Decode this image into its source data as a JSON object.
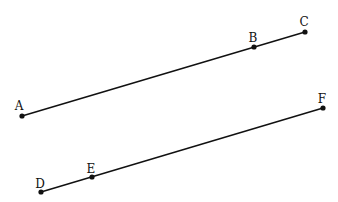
{
  "diagram": {
    "type": "geometry-parallel-segments",
    "points": [
      {
        "label": "A",
        "x": 22,
        "y": 116,
        "lx": 19,
        "ly": 110
      },
      {
        "label": "B",
        "x": 254,
        "y": 47,
        "lx": 253,
        "ly": 42
      },
      {
        "label": "C",
        "x": 305,
        "y": 32,
        "lx": 304,
        "ly": 26
      },
      {
        "label": "D",
        "x": 41,
        "y": 192,
        "lx": 40,
        "ly": 188
      },
      {
        "label": "E",
        "x": 92,
        "y": 177,
        "lx": 91,
        "ly": 173
      },
      {
        "label": "F",
        "x": 323,
        "y": 108,
        "lx": 322,
        "ly": 103
      }
    ],
    "segments": [
      {
        "name": "segment-AC",
        "from": "A",
        "to": "C"
      },
      {
        "name": "segment-DF",
        "from": "D",
        "to": "F"
      }
    ],
    "colors": {
      "line": "#111111",
      "point": "#111111",
      "background": "#ffffff"
    }
  }
}
